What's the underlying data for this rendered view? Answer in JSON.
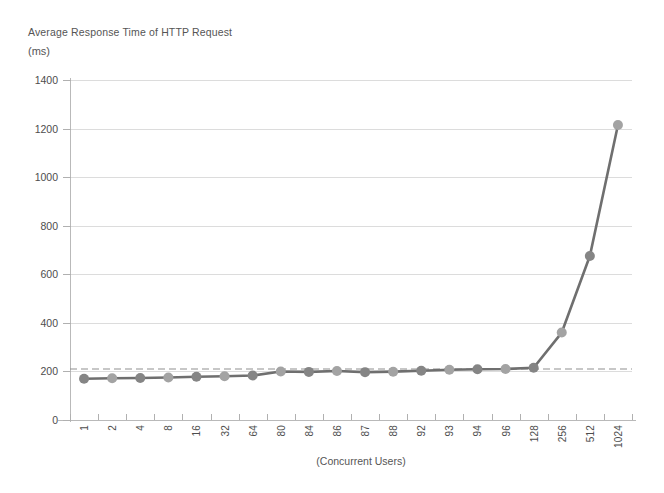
{
  "chart_data": {
    "type": "line",
    "title": "Average Response Time of HTTP Request",
    "subtitle": "(ms)",
    "ylabel": "(ms)",
    "xlabel": "(Concurrent Users)",
    "grid": true,
    "legend": "none",
    "ylim": [
      0,
      1400
    ],
    "yticks": [
      0,
      200,
      400,
      600,
      800,
      1000,
      1200,
      1400
    ],
    "categories": [
      "1",
      "2",
      "4",
      "8",
      "16",
      "32",
      "64",
      "80",
      "84",
      "86",
      "87",
      "88",
      "92",
      "93",
      "94",
      "96",
      "128",
      "256",
      "512",
      "1024"
    ],
    "series": [
      {
        "name": "Average Response Time",
        "color": "#7f7f7f",
        "values": [
          170,
          172,
          173,
          175,
          178,
          180,
          183,
          200,
          198,
          202,
          197,
          199,
          203,
          207,
          209,
          210,
          215,
          360,
          675,
          1215
        ]
      }
    ],
    "annotations": [
      {
        "type": "reference-line",
        "orientation": "horizontal",
        "value": 210,
        "style": "dashed",
        "color": "#909090"
      }
    ]
  },
  "axes": {
    "y_tick_labels": [
      "1400",
      "1200",
      "1000",
      "800",
      "600",
      "400",
      "200",
      "0"
    ],
    "x_tick_labels": [
      "1",
      "2",
      "4",
      "8",
      "16",
      "32",
      "64",
      "80",
      "84",
      "86",
      "87",
      "88",
      "92",
      "93",
      "94",
      "96",
      "128",
      "256",
      "512",
      "1024"
    ]
  },
  "colors": {
    "line": "#6f6f6f",
    "marker": "#8a8a8a",
    "grid": "#dcdcdc",
    "axis": "#b9b9b9",
    "reference_line": "#909090",
    "text": "#4d4d4d",
    "background": "#ffffff"
  }
}
